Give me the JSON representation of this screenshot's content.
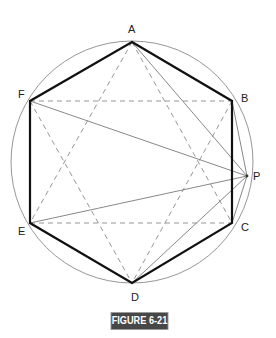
{
  "figure": {
    "caption": "FIGURE 6-21",
    "colors": {
      "heavy": "#111111",
      "thin": "#777777",
      "dashed": "#888888",
      "caption_bg": "#474747",
      "caption_text": "#ffffff"
    },
    "circle": {
      "cx": 132,
      "cy": 162,
      "r": 121
    },
    "points": {
      "A": {
        "label": "A",
        "x": 132,
        "y": 42
      },
      "B": {
        "label": "B",
        "x": 232,
        "y": 101
      },
      "C": {
        "label": "C",
        "x": 232,
        "y": 223
      },
      "D": {
        "label": "D",
        "x": 132,
        "y": 283
      },
      "E": {
        "label": "E",
        "x": 30,
        "y": 223
      },
      "F": {
        "label": "F",
        "x": 30,
        "y": 101
      },
      "P": {
        "label": "P",
        "x": 247,
        "y": 176
      }
    },
    "hexagon_edges": [
      "AB",
      "BC",
      "CD",
      "DE",
      "EF",
      "FA"
    ],
    "dashed_lines": [
      "FB",
      "EC",
      "AE",
      "AC",
      "FD",
      "BD"
    ],
    "thin_lines_to_P": [
      "AP",
      "BP",
      "CP",
      "DP",
      "EP",
      "FP"
    ]
  }
}
